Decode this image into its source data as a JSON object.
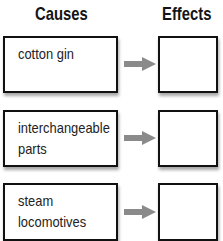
{
  "headers": {
    "causes": "Causes",
    "effects": "Effects"
  },
  "rows": [
    {
      "cause_line1": "cotton gin",
      "cause_line2": "",
      "effect": ""
    },
    {
      "cause_line1": "interchangeable",
      "cause_line2": "parts",
      "effect": ""
    },
    {
      "cause_line1": "steam",
      "cause_line2": "locomotives",
      "effect": ""
    }
  ],
  "colors": {
    "border": "#111111",
    "arrow": "#8a8a8a",
    "text": "#222222"
  }
}
